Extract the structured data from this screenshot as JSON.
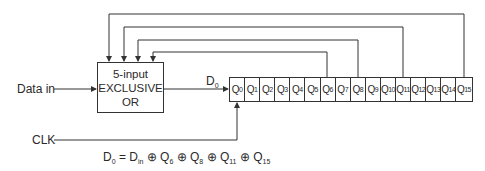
{
  "diagram": {
    "inputs": {
      "data_in_label": "Data in",
      "clk_label": "CLK"
    },
    "xor_gate": {
      "line1": "5-input",
      "line2": "EXCLUSIVE",
      "line3": "OR"
    },
    "output_label": {
      "base": "D",
      "sub": "0"
    },
    "register": {
      "cells": [
        {
          "base": "Q",
          "sub": "0"
        },
        {
          "base": "Q",
          "sub": "1"
        },
        {
          "base": "Q",
          "sub": "2"
        },
        {
          "base": "Q",
          "sub": "3"
        },
        {
          "base": "Q",
          "sub": "4"
        },
        {
          "base": "Q",
          "sub": "5"
        },
        {
          "base": "Q",
          "sub": "6"
        },
        {
          "base": "Q",
          "sub": "7"
        },
        {
          "base": "Q",
          "sub": "8"
        },
        {
          "base": "Q",
          "sub": "9"
        },
        {
          "base": "Q",
          "sub": "10"
        },
        {
          "base": "Q",
          "sub": "11"
        },
        {
          "base": "Q",
          "sub": "12"
        },
        {
          "base": "Q",
          "sub": "13"
        },
        {
          "base": "Q",
          "sub": "14"
        },
        {
          "base": "Q",
          "sub": "15"
        }
      ]
    },
    "feedback_taps": [
      "Q6",
      "Q8",
      "Q11",
      "Q15"
    ],
    "equation": {
      "lhs_base": "D",
      "lhs_sub": "0",
      "eq": " = ",
      "t1_base": "D",
      "t1_sub": "in",
      "op": " ⊕ ",
      "t2_base": "Q",
      "t2_sub": "6",
      "t3_base": "Q",
      "t3_sub": "8",
      "t4_base": "Q",
      "t4_sub": "11",
      "t5_base": "Q",
      "t5_sub": "15"
    }
  }
}
